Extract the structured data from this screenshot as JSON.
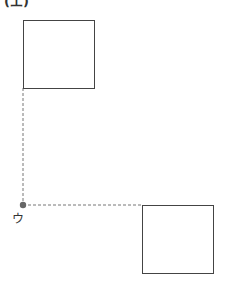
{
  "diagram": {
    "top_label": "(エ)",
    "point_label": "ウ",
    "colors": {
      "stroke": "#444444",
      "dashed": "#777777",
      "point": "#666666",
      "background": "#ffffff"
    },
    "square_1": {
      "x": 23,
      "y": 20,
      "width": 71,
      "height": 68
    },
    "square_2": {
      "x": 142,
      "y": 205,
      "width": 71,
      "height": 68
    },
    "point": {
      "x": 23,
      "y": 205
    }
  }
}
